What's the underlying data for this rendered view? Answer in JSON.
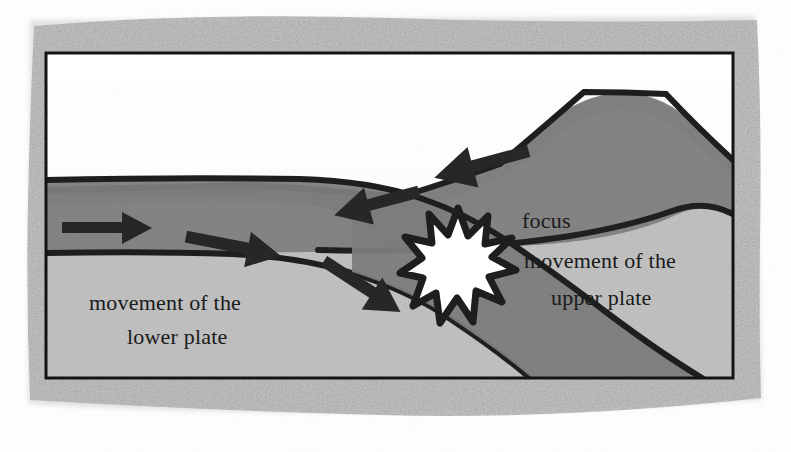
{
  "figure": {
    "name": "subduction-zone-earthquake-focus-diagram",
    "kind": "cross-section illustration",
    "frame": {
      "outer_texture_color": "#b9b9b9",
      "outer_texture_color_dark": "#a2a2a2",
      "inner_border_color": "#141414",
      "sky_color": "#ffffff"
    },
    "palette": {
      "upper_plate_crust": "#808080",
      "lower_plate_slab": "#7d7d7d",
      "mantle_light": "#bcbcbc",
      "outline": "#1e1e1e",
      "focus_fill": "#ffffff",
      "arrow_fill": "#272727",
      "text_color": "#1a1a1a"
    },
    "labels": {
      "focus": "focus",
      "upper_plate_line1": "movement of the",
      "upper_plate_line2": "upper plate",
      "lower_plate_line1": "movement of the",
      "lower_plate_line2": "lower plate"
    },
    "arrows": {
      "lower_plate_right_1": "right-arrow",
      "lower_plate_right_2": "right-arrow",
      "slab_descending": "down-right-arrow",
      "upper_plate_left_1": "left-arrow",
      "upper_plate_left_2": "left-arrow"
    },
    "focus_marker": {
      "name": "earthquake-focus-star",
      "points": 12
    }
  }
}
